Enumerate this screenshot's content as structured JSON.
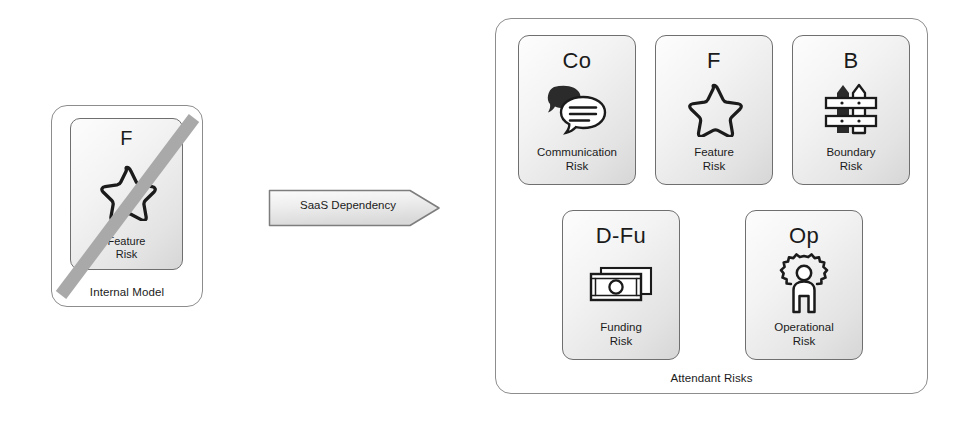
{
  "diagram": {
    "colors": {
      "card_border": "#6f6f6f",
      "group_border": "#8d8d8d",
      "strike": "#a8a8a8",
      "text": "#1b1b1b",
      "icon_dark": "#2b2b2b"
    }
  },
  "internal_model": {
    "label": "Internal Model",
    "card": {
      "code": "F",
      "icon": "star-icon",
      "title": "Feature\nRisk",
      "struck_out": true
    }
  },
  "connector": {
    "label": "SaaS Dependency",
    "shape": "arrow-right"
  },
  "attendant_risks": {
    "label": "Attendant Risks",
    "cards": [
      {
        "id": "communication",
        "code": "Co",
        "icon": "speech-bubbles-icon",
        "title": "Communication\nRisk"
      },
      {
        "id": "feature",
        "code": "F",
        "icon": "star-icon",
        "title": "Feature\nRisk"
      },
      {
        "id": "boundary",
        "code": "B",
        "icon": "fence-icon",
        "title": "Boundary\nRisk"
      },
      {
        "id": "funding",
        "code": "D-Fu",
        "icon": "banknotes-icon",
        "title": "Funding\nRisk"
      },
      {
        "id": "operational",
        "code": "Op",
        "icon": "person-in-gear-icon",
        "title": "Operational\nRisk"
      }
    ]
  }
}
